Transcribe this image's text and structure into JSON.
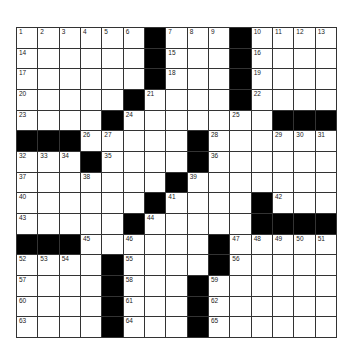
{
  "puzzle": {
    "rows": 15,
    "cols": 15,
    "layout": [
      "......#...#....",
      "......#...#....",
      "......#...#....",
      ".....#....#....",
      "....#.......###",
      "###.....#......",
      "...#....#......",
      ".......#.......",
      "......#....#...",
      ".....#.....####",
      "###......#.....",
      "....#....#.....",
      "....#...#......",
      "....#...#......",
      "....#...#......"
    ],
    "colors": {
      "black": "#000000",
      "white": "#ffffff",
      "line": "#333333"
    }
  }
}
